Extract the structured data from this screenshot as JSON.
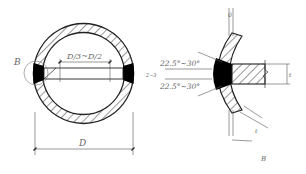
{
  "figure": {
    "left_view": {
      "detail_callout": "B",
      "inner_dimension": "D/3~D/2",
      "outer_dimension": "D"
    },
    "right_view": {
      "detail_label": "B",
      "angle_top": "22.5°~30°",
      "angle_bottom": "22.5°~30°",
      "root_gap": "2~3",
      "plate_thickness": "t",
      "pipe_wall": "t",
      "top_gap": "0",
      "bottom_gap": "0"
    }
  },
  "colors": {
    "line": "#222222",
    "dimension": "#555555",
    "weld_fill": "#000000",
    "text": "#666666"
  }
}
